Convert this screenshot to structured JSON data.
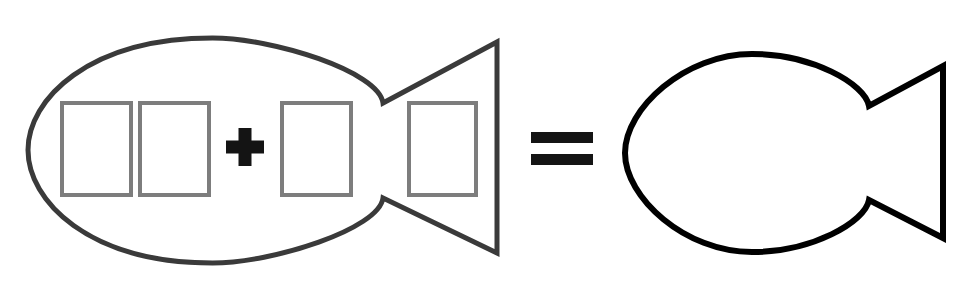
{
  "figure": {
    "description": "A gray fish outline containing four empty rectangles with a plus sign between the second and third rectangle, an equals sign, and a plain black fish outline.",
    "background_color": "#ffffff",
    "width": 969,
    "height": 284
  },
  "chart_data": {
    "type": "diagram",
    "equation_text": "fish(4 parts) = fish",
    "operators": [
      "+",
      "="
    ],
    "terms": [
      {
        "name": "left-fish",
        "kind": "fish-shape",
        "parts": 4,
        "outline_color": "#3a3a3a"
      },
      {
        "name": "right-fish",
        "kind": "fish-shape",
        "parts": 0,
        "outline_color": "#000000"
      }
    ]
  },
  "left_fish": {
    "label": "Fish with four inner rectangles",
    "outline_color": "#3a3a3a",
    "stroke_width": 5,
    "body": {
      "left_x": 28,
      "right_x": 383,
      "top_y": 38,
      "bottom_y": 263,
      "center_y": 150
    },
    "tail": {
      "notch_top": {
        "x": 382,
        "y": 103
      },
      "notch_bottom": {
        "x": 382,
        "y": 198
      },
      "tip_top": {
        "x": 497,
        "y": 42
      },
      "tip_bottom": {
        "x": 497,
        "y": 253
      }
    },
    "inner_rects": [
      {
        "name": "inner-rect-1",
        "x": 62,
        "y": 103,
        "width": 69,
        "height": 92,
        "stroke_color": "#7d7d7d"
      },
      {
        "name": "inner-rect-2",
        "x": 140,
        "y": 103,
        "width": 69,
        "height": 92,
        "stroke_color": "#7d7d7d"
      },
      {
        "name": "inner-rect-3",
        "x": 282,
        "y": 103,
        "width": 69,
        "height": 92,
        "stroke_color": "#7d7d7d"
      },
      {
        "name": "inner-rect-4",
        "x": 409,
        "y": 103,
        "width": 67,
        "height": 92,
        "stroke_color": "#7d7d7d"
      }
    ],
    "plus_sign": {
      "label": "+",
      "center_x": 245,
      "center_y": 147,
      "arm_length": 19,
      "arm_thickness": 13,
      "color": "#141414"
    }
  },
  "equals_sign": {
    "label": "=",
    "color": "#141414",
    "left_x": 531,
    "bar_width": 62,
    "bar_height": 11,
    "top_bar_y": 132,
    "bottom_bar_y": 154
  },
  "right_fish": {
    "label": "Plain fish outline",
    "outline_color": "#000000",
    "stroke_width": 6,
    "body": {
      "left_x": 625,
      "right_x": 869,
      "top_y": 54,
      "bottom_y": 252,
      "center_y": 153
    },
    "tail": {
      "notch_top": {
        "x": 868,
        "y": 106
      },
      "notch_bottom": {
        "x": 868,
        "y": 200
      },
      "tip_top": {
        "x": 943,
        "y": 66
      },
      "tip_bottom": {
        "x": 943,
        "y": 238
      }
    }
  }
}
